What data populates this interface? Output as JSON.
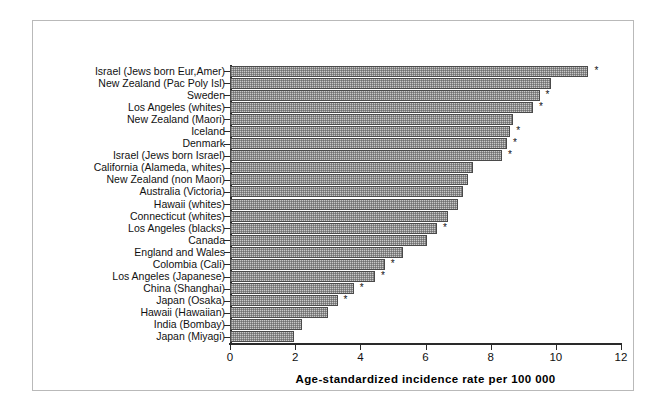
{
  "chart_data": {
    "type": "bar",
    "orientation": "horizontal",
    "title": "",
    "xlabel": "Age-standardized  incidence  rate  per  100 000",
    "ylabel": "",
    "xlim": [
      0,
      12
    ],
    "xticks": [
      0,
      2,
      4,
      6,
      8,
      10,
      12
    ],
    "grid": false,
    "legend": null,
    "annotation_marker": "*",
    "categories": [
      "Israel (Jews born Eur,Amer)",
      "New Zealand (Pac Poly Isl)",
      "Sweden",
      "Los Angeles (whites)",
      "New Zealand (Maori)",
      "Iceland",
      "Denmark",
      "Israel (Jews born Israel)",
      "California (Alameda, whites)",
      "New Zealand (non Maori)",
      "Australia (Victoria)",
      "Hawaii (whites)",
      "Connecticut (whites)",
      "Los Angeles (blacks)",
      "Canada",
      "England and Wales",
      "Colombia (Cali)",
      "Los Angeles (Japanese)",
      "China (Shanghai)",
      "Japan (Osaka)",
      "Hawaii (Hawaiian)",
      "India (Bombay)",
      "Japan (Miyagi)"
    ],
    "values": [
      11.0,
      9.85,
      9.5,
      9.3,
      8.7,
      8.6,
      8.5,
      8.35,
      7.45,
      7.3,
      7.15,
      7.0,
      6.7,
      6.35,
      6.05,
      5.3,
      4.75,
      4.45,
      3.8,
      3.3,
      3.0,
      2.2,
      1.95
    ],
    "starred": [
      true,
      false,
      true,
      true,
      false,
      true,
      true,
      true,
      false,
      false,
      false,
      false,
      false,
      true,
      false,
      false,
      true,
      true,
      true,
      true,
      false,
      false,
      false
    ],
    "bar_color": "#c8c8c8",
    "bar_edge_color": "#4a4a4a",
    "axis_color": "#2a2a2a",
    "frame_color": "#b9b9b9",
    "background_color": "#ffffff"
  }
}
